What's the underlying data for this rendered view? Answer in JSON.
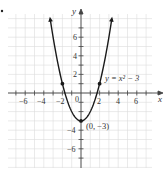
{
  "chart_data": {
    "type": "line",
    "title": "",
    "equation_label": "y = x² − 3",
    "xlabel": "x",
    "ylabel": "y",
    "xlim": [
      -7.5,
      7.5
    ],
    "ylim": [
      -7.5,
      8.5
    ],
    "grid": true,
    "x_tick_labels": [
      "-6",
      "-4",
      "-2",
      "2",
      "4",
      "6"
    ],
    "y_tick_labels": [
      "6",
      "4",
      "2",
      "-4",
      "-6"
    ],
    "origin_label": "0",
    "series": [
      {
        "name": "y = x^2 - 3",
        "function": "x^2 - 3",
        "x": [
          -3.3,
          -3,
          -2,
          -1,
          0,
          1,
          2,
          3,
          3.3
        ],
        "values": [
          7.89,
          6,
          1,
          -2,
          -3,
          -2,
          1,
          6,
          7.89
        ],
        "arrows_at_ends": true
      }
    ],
    "marked_points": [
      {
        "x": -2,
        "y": 1
      },
      {
        "x": 0,
        "y": -3,
        "label": "(0, −3)"
      },
      {
        "x": 2,
        "y": 1
      }
    ]
  },
  "labels": {
    "x_axis": "x",
    "y_axis": "y",
    "equation": "y = x² − 3",
    "vertex": "(0, −3)",
    "origin": "0",
    "xticks": {
      "m6": "−6",
      "m4": "−4",
      "m2": "−2",
      "p2": "2",
      "p4": "4",
      "p6": "6"
    },
    "yticks": {
      "p6": "6",
      "p4": "4",
      "p2": "2",
      "m4": "−4",
      "m6": "−6"
    }
  }
}
